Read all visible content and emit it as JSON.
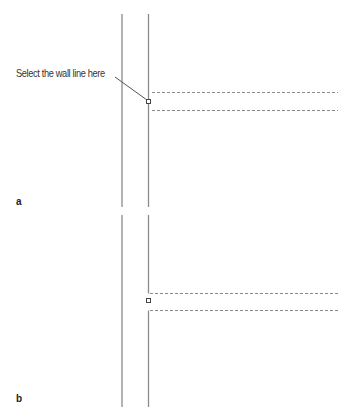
{
  "figure": {
    "panels": [
      {
        "label": "a",
        "callout": "Select the wall line here",
        "description": "Two parallel vertical wall lines; right line continuous, with selection marker and two horizontal dashed lines extending right"
      },
      {
        "label": "b",
        "description": "Same wall lines; right line broken between the two dashed lines where the opening is created, selection marker in gap"
      }
    ],
    "colors": {
      "line": "#8a8a8a",
      "dash": "#8a8a8a",
      "text": "#333333"
    }
  }
}
